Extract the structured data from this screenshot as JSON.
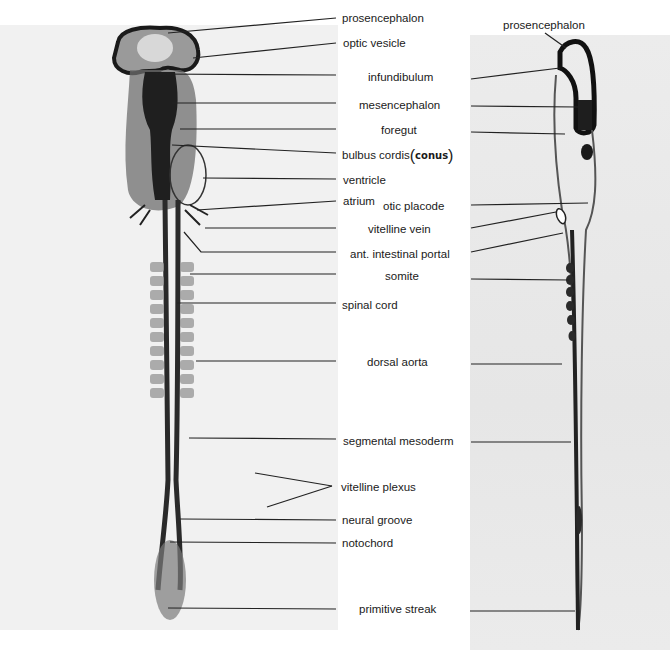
{
  "figure": {
    "type": "labeled micrograph",
    "left_panel": "whole-mount embryo, dorsal view",
    "right_panel": "sagittal section"
  },
  "labels": {
    "prosencephalon": "prosencephalon",
    "optic_vesicle": "optic vesicle",
    "infundibulum": "infundibulum",
    "mesencephalon": "mesencephalon",
    "foregut": "foregut",
    "bulbus_cordis": "bulbus cordis",
    "bulbus_cordis_note": "conus",
    "ventricle": "ventricle",
    "atrium": "atrium",
    "otic_placode": "otic placode",
    "vitelline_vein": "vitelline vein",
    "ant_intestinal_portal": "ant. intestinal portal",
    "somite": "somite",
    "spinal_cord": "spinal cord",
    "dorsal_aorta": "dorsal aorta",
    "segmental_mesoderm": "segmental mesoderm",
    "vitelline_plexus": "vitelline plexus",
    "neural_groove": "neural groove",
    "notochord": "notochord",
    "primitive_streak": "primitive streak",
    "right_prosencephalon": "prosencephalon"
  },
  "colors": {
    "background": "#ffffff",
    "tissue_dark": "#1c1c1c",
    "photo_bg": "#ececec",
    "leader_line": "#222222"
  }
}
